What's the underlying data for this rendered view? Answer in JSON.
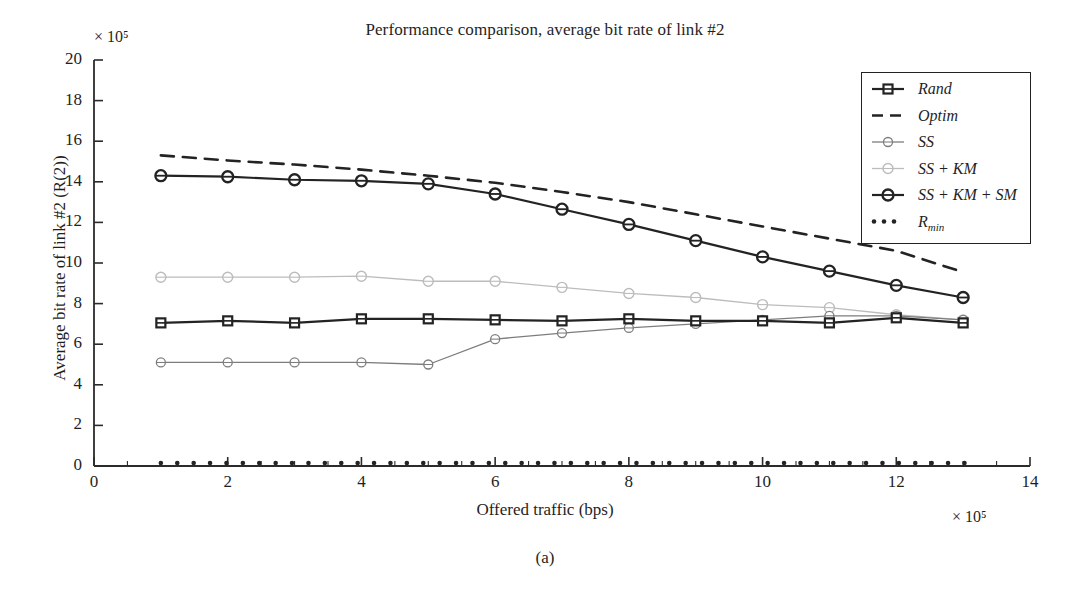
{
  "figure": {
    "title": "Performance comparison, average bit rate of link #2",
    "caption": "(a)",
    "xlabel": "Offered traffic (bps)",
    "ylabel": "Average bit rate of link #2 (R(2))",
    "x_multiplier": "× 10⁵",
    "y_multiplier": "× 10⁵"
  },
  "legend": {
    "entries": [
      {
        "label": "Rand",
        "marker": "square",
        "color": "#232323",
        "style": "solid"
      },
      {
        "label": "Optim",
        "marker": "none",
        "color": "#232323",
        "style": "dashed"
      },
      {
        "label": "SS",
        "marker": "circle",
        "color": "#7d7d7d",
        "style": "solid"
      },
      {
        "label": "SS + KM",
        "marker": "circle",
        "color": "#bcbcbc",
        "style": "solid"
      },
      {
        "label": "SS + KM + SM",
        "marker": "circle",
        "color": "#232323",
        "style": "solid"
      },
      {
        "label": "Rmin",
        "marker": "dots",
        "color": "#232323",
        "style": "dotted"
      }
    ]
  },
  "chart_data": {
    "type": "line",
    "title": "Performance comparison, average bit rate of link #2",
    "xlabel": "Offered traffic (bps)",
    "ylabel": "Average bit rate of link #2 (R(2))",
    "xlim": [
      0,
      14
    ],
    "ylim": [
      0,
      20
    ],
    "xticks": [
      0,
      2,
      4,
      6,
      8,
      10,
      12,
      14
    ],
    "yticks": [
      0,
      2,
      4,
      6,
      8,
      10,
      12,
      14,
      16,
      18,
      20
    ],
    "x_scale_note": "values × 10^5 bps",
    "y_scale_note": "values × 10^5",
    "grid": false,
    "legend_position": "upper right",
    "x": [
      1,
      2,
      3,
      4,
      5,
      6,
      7,
      8,
      9,
      10,
      11,
      12,
      13
    ],
    "series": [
      {
        "name": "Rand",
        "values": [
          7.05,
          7.15,
          7.05,
          7.25,
          7.25,
          7.2,
          7.15,
          7.25,
          7.15,
          7.15,
          7.05,
          7.3,
          7.05
        ]
      },
      {
        "name": "Optim",
        "values": [
          15.3,
          15.05,
          14.85,
          14.6,
          14.3,
          13.95,
          13.5,
          13.0,
          12.4,
          11.8,
          11.2,
          10.6,
          9.55
        ]
      },
      {
        "name": "SS",
        "values": [
          5.1,
          5.1,
          5.1,
          5.1,
          5.0,
          6.25,
          6.55,
          6.8,
          7.0,
          7.2,
          7.4,
          7.4,
          7.2
        ]
      },
      {
        "name": "SS + KM",
        "values": [
          9.3,
          9.3,
          9.3,
          9.35,
          9.1,
          9.1,
          8.8,
          8.5,
          8.3,
          7.95,
          7.8,
          7.45,
          7.2
        ]
      },
      {
        "name": "SS + KM + SM",
        "values": [
          14.3,
          14.25,
          14.1,
          14.05,
          13.9,
          13.4,
          12.65,
          11.9,
          11.1,
          10.3,
          9.6,
          8.9,
          8.3
        ]
      },
      {
        "name": "Rmin",
        "values": [
          0.15,
          0.15,
          0.15,
          0.15,
          0.15,
          0.15,
          0.15,
          0.15,
          0.15,
          0.15,
          0.15,
          0.15,
          0.15
        ]
      }
    ]
  }
}
